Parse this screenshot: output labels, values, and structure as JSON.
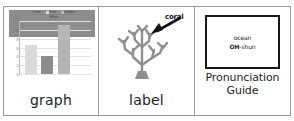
{
  "panels": {
    "graph": {
      "caption": "graph",
      "chart_data": {
        "type": "bar",
        "title": "",
        "xlabel": "",
        "ylabel": "",
        "categories": [
          "1",
          "2",
          "3",
          "4"
        ],
        "values": [
          3,
          6.5,
          4,
          11
        ],
        "colors": [
          "#8c8c8c",
          "#d9d9d9",
          "#8c8c8c",
          "#b5b5b5"
        ],
        "yticks": [
          0,
          2,
          4,
          6,
          8,
          10,
          12
        ],
        "ylim": [
          0,
          12
        ],
        "grid": true,
        "legend_position": "top",
        "legend": [
          {
            "label": "Turtle",
            "color": "#8c8c8c"
          },
          {
            "label": "Fish",
            "color": "#d9d9d9"
          },
          {
            "label": "Dolphin",
            "color": "#b5b5b5"
          },
          {
            "label": "Whale",
            "color": "#8c8c8c"
          }
        ]
      }
    },
    "label": {
      "caption": "label",
      "annotation": "coral",
      "arrow_name": "arrow-pointing-to-coral"
    },
    "pronunciation": {
      "word": "ocean",
      "say_stressed": "OH",
      "say_rest": "-shun",
      "caption_line1": "Pronunciation",
      "caption_line2": "Guide"
    }
  }
}
